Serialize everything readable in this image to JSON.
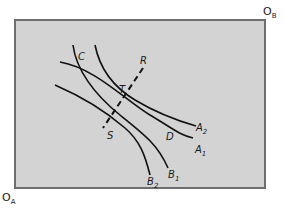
{
  "diagram": {
    "type": "edgeworth-box",
    "origins": {
      "a": {
        "label": "O",
        "sub": "A"
      },
      "b": {
        "label": "O",
        "sub": "B"
      }
    },
    "curves": {
      "a1": {
        "label": "A",
        "sub": "1"
      },
      "a2": {
        "label": "A",
        "sub": "2"
      },
      "b1": {
        "label": "B",
        "sub": "1"
      },
      "b2": {
        "label": "B",
        "sub": "2"
      }
    },
    "points": {
      "c": "C",
      "d": "D",
      "s": "S",
      "t": "T",
      "r": "R"
    },
    "colors": {
      "box_fill": "#d3d3d3",
      "box_border": "#6e6e6e",
      "curve": "#111111"
    }
  }
}
